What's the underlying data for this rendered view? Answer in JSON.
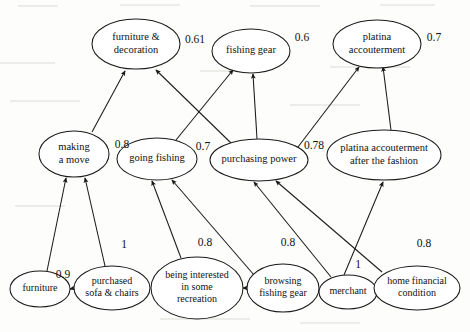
{
  "diagram": {
    "type": "weighted-directed-graph",
    "title": "",
    "nodes": [
      {
        "id": "furniture_decoration",
        "label": [
          "furniture &",
          "decoration"
        ],
        "cx": 136,
        "cy": 44,
        "rx": 44,
        "ry": 25,
        "font": 10.5,
        "weight": "0.61",
        "weight_x": 195,
        "weight_y": 40
      },
      {
        "id": "fishing_gear",
        "label": [
          "fishing gear"
        ],
        "cx": 251,
        "cy": 51,
        "rx": 39,
        "ry": 22,
        "font": 10.5,
        "weight": "0.6",
        "weight_x": 302,
        "weight_y": 38
      },
      {
        "id": "platina_accouterment",
        "label": [
          "platina",
          "accouterment"
        ],
        "cx": 377,
        "cy": 44,
        "rx": 44,
        "ry": 24,
        "font": 10.5,
        "weight": "0.7",
        "weight_x": 434,
        "weight_y": 38
      },
      {
        "id": "making_a_move",
        "label": [
          "making",
          "a move"
        ],
        "cx": 74,
        "cy": 154,
        "rx": 35,
        "ry": 23,
        "font": 10.5,
        "weight": "0.8",
        "weight_x": 122,
        "weight_y": 145
      },
      {
        "id": "going_fishing",
        "label": [
          "going fishing"
        ],
        "cx": 157,
        "cy": 159,
        "rx": 40,
        "ry": 21,
        "font": 10.5,
        "weight": "0.7",
        "weight_x": 203,
        "weight_y": 147
      },
      {
        "id": "purchasing_power",
        "label": [
          "purchasing power"
        ],
        "cx": 259,
        "cy": 160,
        "rx": 49,
        "ry": 21,
        "font": 10.5,
        "weight": "0.78",
        "weight_x": 314,
        "weight_y": 146
      },
      {
        "id": "platina_after_fashion",
        "label": [
          "platina accouterment",
          "after the fashion"
        ],
        "cx": 384,
        "cy": 155,
        "rx": 57,
        "ry": 25,
        "font": 10.5,
        "weight": "",
        "weight_x": 0,
        "weight_y": 0
      },
      {
        "id": "furniture",
        "label": [
          "furniture"
        ],
        "cx": 40,
        "cy": 289,
        "rx": 30,
        "ry": 18,
        "font": 10,
        "weight": "0.9",
        "weight_x": 63,
        "weight_y": 275
      },
      {
        "id": "purchased_sofa_chairs",
        "label": [
          "purchased",
          "sofa & chairs"
        ],
        "cx": 112,
        "cy": 288,
        "rx": 38,
        "ry": 22,
        "font": 10,
        "weight": "1",
        "weight_x": 124,
        "weight_y": 245
      },
      {
        "id": "being_interested",
        "label": [
          "being interested",
          "in some",
          "recreation"
        ],
        "cx": 197,
        "cy": 288,
        "rx": 46,
        "ry": 31,
        "font": 10,
        "weight": "0.8",
        "weight_x": 205,
        "weight_y": 243
      },
      {
        "id": "browsing_fishing_gear",
        "label": [
          "browsing",
          "fishing gear"
        ],
        "cx": 283,
        "cy": 288,
        "rx": 36,
        "ry": 24,
        "font": 10,
        "weight": "0.8",
        "weight_x": 288,
        "weight_y": 243
      },
      {
        "id": "merchant",
        "label": [
          "merchant"
        ],
        "cx": 348,
        "cy": 292,
        "rx": 29,
        "ry": 17,
        "font": 10,
        "weight": "1",
        "weight_x": 358,
        "weight_y": 265
      },
      {
        "id": "home_financial_condition",
        "label": [
          "home financial",
          "condition"
        ],
        "cx": 417,
        "cy": 288,
        "rx": 43,
        "ry": 22,
        "font": 10,
        "weight": "0.8",
        "weight_x": 424,
        "weight_y": 244
      }
    ],
    "edges": [
      {
        "id": "e1",
        "from": "making_a_move",
        "to": "furniture_decoration",
        "weight": "0.8",
        "path": "M 92 132 L 125 71"
      },
      {
        "id": "e2",
        "from": "purchasing_power",
        "to": "furniture_decoration",
        "weight": "0.78",
        "path": "M 231 143 L 156 70"
      },
      {
        "id": "e3",
        "from": "going_fishing",
        "to": "fishing_gear",
        "weight": "0.7",
        "path": "M 176 140 L 233 70"
      },
      {
        "id": "e4",
        "from": "purchasing_power",
        "to": "fishing_gear",
        "weight": "0.78",
        "path": "M 257 139 L 253 74"
      },
      {
        "id": "e5",
        "from": "purchasing_power",
        "to": "platina_accouterment",
        "weight": "0.78",
        "path": "M 298 147 L 359 67"
      },
      {
        "id": "e6",
        "from": "platina_after_fashion",
        "to": "platina_accouterment",
        "weight": "1",
        "path": "M 391 130 L 383 67"
      },
      {
        "id": "e7",
        "from": "furniture",
        "to": "making_a_move",
        "weight": "0.9",
        "path": "M 47 271 L 66 178"
      },
      {
        "id": "e8",
        "from": "purchased_sofa_chairs",
        "to": "making_a_move",
        "weight": "1",
        "path": "M 105 266 L 85 178"
      },
      {
        "id": "e9",
        "from": "purchased_sofa_chairs",
        "to": "furniture",
        "weight": "",
        "path": "M 74 289 L 72 289"
      },
      {
        "id": "e10",
        "from": "being_interested",
        "to": "going_fishing",
        "weight": "0.8",
        "path": "M 181 258 L 152 181"
      },
      {
        "id": "e11",
        "from": "browsing_fishing_gear",
        "to": "going_fishing",
        "weight": "0.8",
        "path": "M 254 275 L 172 180"
      },
      {
        "id": "e12",
        "from": "browsing_fishing_gear",
        "to": "being_interested",
        "weight": "",
        "path": "M 247 288 L 245 288"
      },
      {
        "id": "e13",
        "from": "merchant",
        "to": "purchasing_power",
        "weight": "1",
        "path": "M 331 277 L 254 182"
      },
      {
        "id": "e14",
        "from": "home_financial_condition",
        "to": "purchasing_power",
        "weight": "0.8",
        "path": "M 382 272 L 276 181"
      },
      {
        "id": "e15",
        "from": "merchant",
        "to": "platina_after_fashion",
        "weight": "1",
        "path": "M 344 275 L 383 182"
      }
    ]
  }
}
